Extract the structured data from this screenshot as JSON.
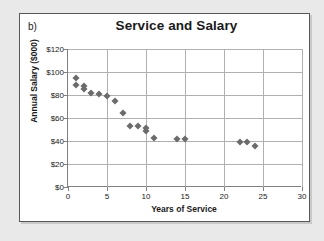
{
  "figure": {
    "part_label": "b)"
  },
  "colors": {
    "page_background": "#e9e9e9",
    "card_background": "#ffffff",
    "card_border": "#585858",
    "marker": "#6b6b6b",
    "gridline": "#b0b0b0",
    "axis": "#808080",
    "text": "#1a1a1a"
  },
  "chart_data": {
    "type": "scatter",
    "title": "Service and Salary",
    "xlabel": "Years of Service",
    "ylabel": "Annual Salary ($000)",
    "xlim": [
      0,
      30
    ],
    "ylim": [
      0,
      120
    ],
    "xticks": [
      0,
      5,
      10,
      15,
      20,
      25,
      30
    ],
    "xtick_labels": [
      "0",
      "5",
      "10",
      "15",
      "20",
      "25",
      "30"
    ],
    "yticks": [
      0,
      20,
      40,
      60,
      80,
      100,
      120
    ],
    "ytick_labels": [
      "$0",
      "$20",
      "$40",
      "$60",
      "$80",
      "$100",
      "$120"
    ],
    "grid": "horizontal-and-vertical",
    "legend": "none",
    "marker_shape": "diamond",
    "series": [
      {
        "name": "Employees",
        "x": [
          1,
          1,
          2,
          2,
          3,
          4,
          5,
          6,
          7,
          8,
          9,
          10,
          10,
          11,
          14,
          15,
          22,
          23,
          24
        ],
        "y": [
          95,
          89,
          88,
          85,
          82,
          81,
          79,
          75,
          64,
          53,
          53,
          51,
          49,
          43,
          42,
          42,
          39,
          39,
          36
        ]
      }
    ]
  }
}
